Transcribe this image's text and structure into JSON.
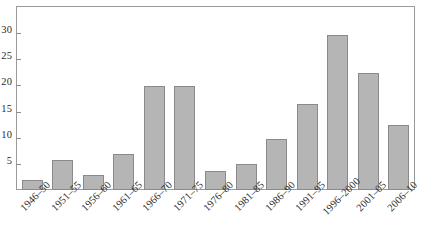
{
  "chart_data": {
    "type": "bar",
    "title": "",
    "subtitle": "",
    "xlabel": "",
    "ylabel": "",
    "categories": [
      "1946–50",
      "1951–55",
      "1956–60",
      "1961–65",
      "1966–70",
      "1971–75",
      "1976–80",
      "1981–85",
      "1986–90",
      "1991–95",
      "1996–2000",
      "2001–05",
      "2006–10"
    ],
    "values": [
      1.9,
      5.8,
      2.9,
      6.9,
      19.9,
      19.8,
      3.6,
      4.9,
      9.7,
      16.5,
      29.6,
      22.4,
      12.5
    ],
    "ylim": [
      0,
      35
    ],
    "yticks": [
      5,
      10,
      15,
      20,
      25,
      30
    ],
    "ytick_labels": [
      "5",
      "10",
      "15",
      "20",
      "25",
      "30"
    ],
    "grid": false,
    "legend": null,
    "legend_position": "none",
    "annotations": [],
    "colors": {
      "bar_fill": "#b5b5b5",
      "bar_border": "#8a8a8a",
      "axis": "#9a9a9a",
      "text": "#2b2b2b",
      "background": "#ffffff"
    }
  }
}
